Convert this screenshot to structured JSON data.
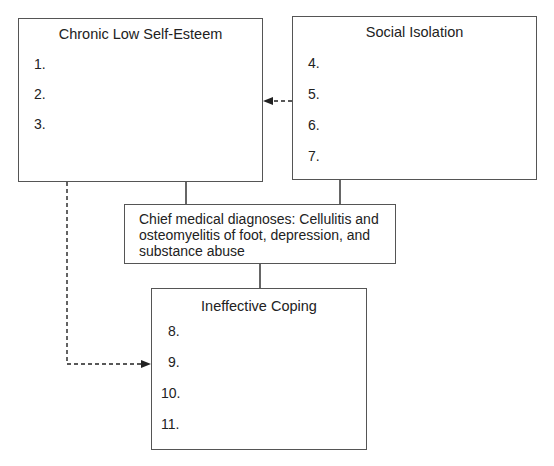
{
  "nodes": {
    "chronic_low_self_esteem": {
      "title": "Chronic Low Self-Esteem",
      "items": [
        "1.",
        "2.",
        "3."
      ]
    },
    "social_isolation": {
      "title": "Social Isolation",
      "items": [
        "4.",
        "5.",
        "6.",
        "7."
      ]
    },
    "chief_diagnoses": {
      "text": "Chief medical diagnoses: Cellulitis and osteomyelitis of foot, depression, and substance abuse"
    },
    "ineffective_coping": {
      "title": "Ineffective Coping",
      "items": [
        "8.",
        "9.",
        "10.",
        "11."
      ]
    }
  },
  "edges": [
    {
      "from": "chronic_low_self_esteem",
      "to": "chief_diagnoses",
      "style": "solid"
    },
    {
      "from": "social_isolation",
      "to": "chief_diagnoses",
      "style": "solid"
    },
    {
      "from": "chief_diagnoses",
      "to": "ineffective_coping",
      "style": "solid"
    },
    {
      "from": "social_isolation",
      "to": "chronic_low_self_esteem",
      "style": "dashed-arrow"
    },
    {
      "from": "chronic_low_self_esteem",
      "to": "ineffective_coping",
      "style": "dashed-arrow"
    }
  ]
}
